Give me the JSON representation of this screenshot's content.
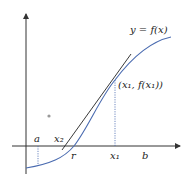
{
  "diagram": {
    "type": "newtons-method-illustration",
    "curve_label": "y = f(x)",
    "point_label": "(x₁, f(x₁))",
    "axis_labels": {
      "a": "a",
      "x2": "x₂",
      "r": "r",
      "x1": "x₁",
      "b": "b"
    },
    "colors": {
      "curve": "#4a6bb0",
      "tangent": "#222222",
      "axes": "#333333",
      "dotted": "#4a6bb0"
    }
  }
}
